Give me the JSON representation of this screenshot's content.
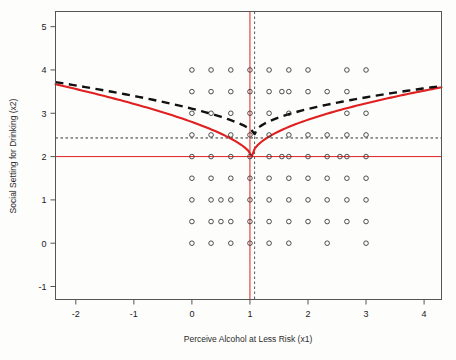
{
  "chart_data": {
    "type": "scatter",
    "title": "",
    "xlabel": "Perceive Alcohol at Less Risk (x1)",
    "ylabel": "Social Setting for Drinking (x2)",
    "xlim": [
      -2.35,
      4.3
    ],
    "ylim": [
      -1.3,
      5.35
    ],
    "xticks": [
      -2,
      -1,
      0,
      1,
      2,
      3,
      4
    ],
    "xtick_labels": [
      "-2",
      "-1",
      "0",
      "1",
      "2",
      "3",
      "4"
    ],
    "yticks": [
      -1,
      0,
      1,
      2,
      3,
      4,
      5
    ],
    "ytick_labels": [
      "-1",
      "0",
      "1",
      "2",
      "3",
      "4",
      "5"
    ],
    "grid": false,
    "legend": "none",
    "marker": "open-circle",
    "points": [
      [
        0.0,
        4.0
      ],
      [
        0.33,
        4.0
      ],
      [
        0.67,
        4.0
      ],
      [
        1.0,
        4.0
      ],
      [
        1.33,
        4.0
      ],
      [
        1.67,
        4.0
      ],
      [
        2.0,
        4.0
      ],
      [
        2.67,
        4.0
      ],
      [
        3.0,
        4.0
      ],
      [
        0.0,
        3.5
      ],
      [
        0.33,
        3.5
      ],
      [
        0.67,
        3.5
      ],
      [
        1.0,
        3.5
      ],
      [
        1.33,
        3.5
      ],
      [
        1.55,
        3.5
      ],
      [
        1.67,
        3.5
      ],
      [
        2.0,
        3.5
      ],
      [
        2.33,
        3.5
      ],
      [
        2.67,
        3.5
      ],
      [
        0.0,
        3.0
      ],
      [
        0.33,
        3.0
      ],
      [
        0.67,
        3.0
      ],
      [
        1.0,
        3.0
      ],
      [
        1.33,
        3.0
      ],
      [
        1.67,
        3.0
      ],
      [
        2.67,
        3.0
      ],
      [
        3.0,
        3.0
      ],
      [
        0.0,
        2.5
      ],
      [
        0.33,
        2.5
      ],
      [
        0.67,
        2.5
      ],
      [
        1.0,
        2.5
      ],
      [
        1.33,
        2.5
      ],
      [
        1.67,
        2.5
      ],
      [
        2.0,
        2.5
      ],
      [
        2.33,
        2.5
      ],
      [
        2.67,
        2.5
      ],
      [
        3.0,
        2.5
      ],
      [
        0.0,
        2.0
      ],
      [
        0.33,
        2.0
      ],
      [
        0.67,
        2.0
      ],
      [
        1.0,
        2.0
      ],
      [
        1.33,
        2.0
      ],
      [
        1.55,
        2.0
      ],
      [
        1.67,
        2.0
      ],
      [
        2.0,
        2.0
      ],
      [
        2.33,
        2.0
      ],
      [
        2.55,
        2.0
      ],
      [
        2.67,
        2.0
      ],
      [
        3.0,
        2.0
      ],
      [
        0.0,
        1.5
      ],
      [
        0.33,
        1.5
      ],
      [
        0.67,
        1.5
      ],
      [
        1.0,
        1.5
      ],
      [
        1.33,
        1.5
      ],
      [
        1.67,
        1.5
      ],
      [
        2.0,
        1.5
      ],
      [
        2.33,
        1.5
      ],
      [
        2.67,
        1.5
      ],
      [
        3.0,
        1.5
      ],
      [
        0.0,
        1.0
      ],
      [
        0.33,
        1.0
      ],
      [
        0.5,
        1.0
      ],
      [
        0.67,
        1.0
      ],
      [
        1.0,
        1.0
      ],
      [
        1.33,
        1.0
      ],
      [
        1.67,
        1.0
      ],
      [
        2.0,
        1.0
      ],
      [
        2.33,
        1.0
      ],
      [
        2.67,
        1.0
      ],
      [
        3.0,
        1.0
      ],
      [
        0.0,
        0.5
      ],
      [
        0.33,
        0.5
      ],
      [
        0.5,
        0.5
      ],
      [
        0.67,
        0.5
      ],
      [
        1.0,
        0.5
      ],
      [
        1.33,
        0.5
      ],
      [
        1.67,
        0.5
      ],
      [
        2.0,
        0.5
      ],
      [
        2.33,
        0.5
      ],
      [
        2.67,
        0.5
      ],
      [
        3.0,
        0.5
      ],
      [
        0.0,
        0.0
      ],
      [
        0.33,
        0.0
      ],
      [
        0.67,
        0.0
      ],
      [
        1.0,
        0.0
      ],
      [
        1.33,
        0.0
      ],
      [
        1.67,
        0.0
      ],
      [
        2.33,
        0.0
      ],
      [
        3.0,
        0.0
      ]
    ],
    "series": [
      {
        "name": "solid-red-curve",
        "style": "solid",
        "color": "#e02020",
        "vertex": [
          1.03,
          2.0
        ],
        "left_endpoint": [
          -2.35,
          3.67
        ],
        "right_endpoint": [
          4.3,
          3.6
        ],
        "shape": "v-shaped-concave"
      },
      {
        "name": "dashed-black-curve",
        "style": "dashed",
        "color": "#111111",
        "vertex": [
          1.08,
          2.52
        ],
        "left_endpoint": [
          -2.35,
          3.72
        ],
        "right_endpoint": [
          4.3,
          3.63
        ],
        "shape": "v-shaped-concave"
      }
    ],
    "reference_lines": [
      {
        "name": "vertical-red-line",
        "orientation": "vertical",
        "value": 1.0,
        "color": "#e02020",
        "style": "solid"
      },
      {
        "name": "vertical-black-dashed-line",
        "orientation": "vertical",
        "value": 1.08,
        "color": "#555555",
        "style": "dashed"
      },
      {
        "name": "horizontal-red-line",
        "orientation": "horizontal",
        "value": 2.0,
        "color": "#e02020",
        "style": "solid"
      },
      {
        "name": "horizontal-black-dashed-line",
        "orientation": "horizontal",
        "value": 2.43,
        "color": "#333333",
        "style": "dashed"
      }
    ]
  },
  "colors": {
    "red": "#e02020",
    "black": "#111111",
    "frame": "#555555",
    "point_stroke": "#3a3a3a",
    "background": "#fdfdfc"
  }
}
